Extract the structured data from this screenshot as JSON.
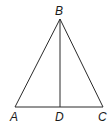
{
  "diagram": {
    "type": "geometry-triangle",
    "stroke_color": "#2a2a2a",
    "points": {
      "A": {
        "label": "A",
        "x": 15,
        "y": 107
      },
      "B": {
        "label": "B",
        "x": 60,
        "y": 19
      },
      "C": {
        "label": "C",
        "x": 103,
        "y": 107
      },
      "D": {
        "label": "D",
        "x": 60,
        "y": 107
      }
    },
    "segments": [
      "AB",
      "BC",
      "AC",
      "BD"
    ],
    "labels": {
      "A": "A",
      "B": "B",
      "C": "C",
      "D": "D"
    }
  }
}
